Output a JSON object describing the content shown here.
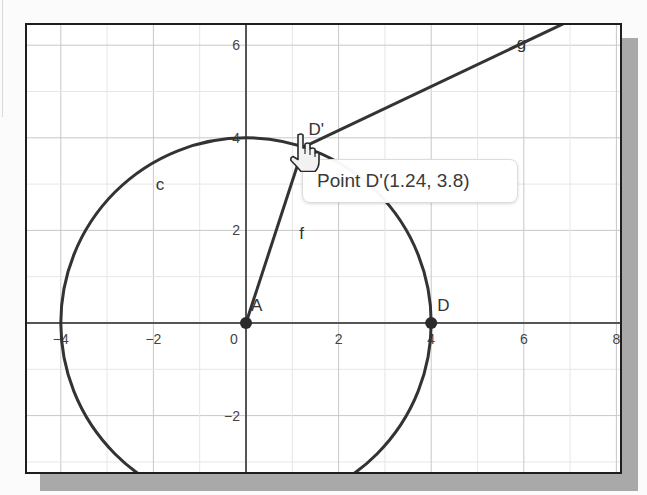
{
  "graphics_view": {
    "origin_px": [
      246,
      323
    ],
    "scale_px_per_unit": 46.3,
    "x_ticks": [
      {
        "value": -4,
        "label": "−4"
      },
      {
        "value": -2,
        "label": "−2"
      },
      {
        "value": 0,
        "label": "0"
      },
      {
        "value": 2,
        "label": "2"
      },
      {
        "value": 4,
        "label": "4"
      },
      {
        "value": 6,
        "label": "6"
      },
      {
        "value": 8,
        "label": "8"
      }
    ],
    "y_ticks": [
      {
        "value": 6,
        "label": "6"
      },
      {
        "value": 4,
        "label": "4"
      },
      {
        "value": 2,
        "label": "2"
      },
      {
        "value": -2,
        "label": "−2"
      }
    ],
    "grid": {
      "major_step": 2,
      "minor_step": 1,
      "color_major": "#c8c8c8",
      "color_minor": "#e6e6e6"
    }
  },
  "objects": {
    "circle_c": {
      "label": "c",
      "center": [
        0,
        0
      ],
      "radius": 4,
      "label_pos": [
        -1.95,
        3.0
      ]
    },
    "point_A": {
      "label": "A",
      "coords": [
        0,
        0
      ]
    },
    "point_D": {
      "label": "D",
      "coords": [
        4,
        0
      ]
    },
    "point_D_prime": {
      "label": "D'",
      "coords": [
        1.24,
        3.8
      ]
    },
    "segment_f": {
      "label": "f",
      "from": "A",
      "to": "D'",
      "label_pos": [
        1.15,
        1.95
      ]
    },
    "line_g": {
      "label": "g",
      "through": [
        [
          1.24,
          3.8
        ],
        [
          6.89,
          6.48
        ]
      ],
      "label_pos": [
        5.85,
        6.05
      ]
    }
  },
  "tooltip": {
    "text": "Point D'(1.24, 3.8)"
  },
  "cursor": {
    "type": "hand-pointer-icon"
  },
  "colors": {
    "curve": "#333333",
    "axis": "#555555",
    "point": "#2b2b2b",
    "frame": "#1e1e1e",
    "shadow": "#a9a9a9"
  }
}
